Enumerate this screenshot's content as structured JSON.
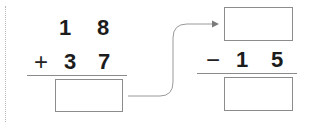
{
  "problem_left": {
    "top_row": [
      "1",
      "8"
    ],
    "operator": "+",
    "bottom_row": [
      "3",
      "7"
    ],
    "answer_box": ""
  },
  "arrow": {
    "direction": "left-answer-to-right-top"
  },
  "problem_right": {
    "top_box": "",
    "operator": "−",
    "bottom_row": [
      "1",
      "5"
    ],
    "answer_box": ""
  },
  "colors": {
    "text": "#1c1c1c",
    "lines": "#8a8a8a",
    "arrow": "#9a9a9a",
    "dotted_margin": "#b8b8b8"
  }
}
